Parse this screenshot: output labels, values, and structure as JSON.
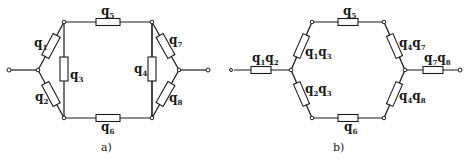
{
  "diagram_a": {
    "caption": "a)",
    "labels": {
      "q1": {
        "base": "q",
        "sub": "1"
      },
      "q2": {
        "base": "q",
        "sub": "2"
      },
      "q3": {
        "base": "q",
        "sub": "3"
      },
      "q4": {
        "base": "q",
        "sub": "4"
      },
      "q5": {
        "base": "q",
        "sub": "5"
      },
      "q6": {
        "base": "q",
        "sub": "6"
      },
      "q7": {
        "base": "q",
        "sub": "7"
      },
      "q8": {
        "base": "q",
        "sub": "8"
      }
    }
  },
  "diagram_b": {
    "caption": "b)",
    "labels": {
      "q1q2": {
        "a": "q",
        "as": "1",
        "b": "q",
        "bs": "2"
      },
      "q1q3": {
        "a": "q",
        "as": "1",
        "b": "q",
        "bs": "3"
      },
      "q2q3": {
        "a": "q",
        "as": "2",
        "b": "q",
        "bs": "3"
      },
      "q5": {
        "base": "q",
        "sub": "5"
      },
      "q6": {
        "base": "q",
        "sub": "6"
      },
      "q4q7": {
        "a": "q",
        "as": "4",
        "b": "q",
        "bs": "7"
      },
      "q4q8": {
        "a": "q",
        "as": "4",
        "b": "q",
        "bs": "8"
      },
      "q7q8": {
        "a": "q",
        "as": "7",
        "b": "q",
        "bs": "8"
      }
    }
  }
}
